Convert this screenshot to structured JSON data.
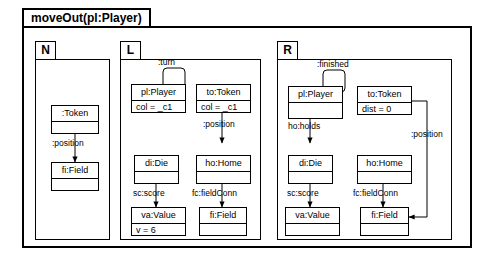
{
  "rule": {
    "title": "moveOut(pl:Player)"
  },
  "panels": [
    {
      "key": "N",
      "tab_label": "N",
      "nodes": [
        {
          "id": "n_token",
          "header": ":Token",
          "attr": ""
        },
        {
          "id": "n_field",
          "header": "fi:Field",
          "attr": ""
        }
      ],
      "edges": [
        {
          "label": ":position",
          "from": "n_token",
          "to": "n_field"
        }
      ]
    },
    {
      "key": "L",
      "tab_label": "L",
      "nodes": [
        {
          "id": "l_player",
          "header": "pl:Player",
          "attr": "col = _c1"
        },
        {
          "id": "l_token",
          "header": "to:Token",
          "attr": "col = _c1"
        },
        {
          "id": "l_die",
          "header": "di:Die",
          "attr": ""
        },
        {
          "id": "l_home",
          "header": "ho:Home",
          "attr": ""
        },
        {
          "id": "l_value",
          "header": "va:Value",
          "attr": "v = 6"
        },
        {
          "id": "l_field",
          "header": "fi:Field",
          "attr": ""
        }
      ],
      "edges": [
        {
          "label": ":turn",
          "from": "l_player",
          "to": "l_player"
        },
        {
          "label": ":position",
          "from": "l_token",
          "to": "l_home"
        },
        {
          "label": "sc:score",
          "from": "l_die",
          "to": "l_value"
        },
        {
          "label": "fc:fieldConn",
          "from": "l_home",
          "to": "l_field"
        }
      ]
    },
    {
      "key": "R",
      "tab_label": "R",
      "nodes": [
        {
          "id": "r_player",
          "header": "pl:Player",
          "attr": ""
        },
        {
          "id": "r_token",
          "header": "to:Token",
          "attr": "dist = 0"
        },
        {
          "id": "r_die",
          "header": "di:Die",
          "attr": ""
        },
        {
          "id": "r_home",
          "header": "ho:Home",
          "attr": ""
        },
        {
          "id": "r_value",
          "header": "va:Value",
          "attr": ""
        },
        {
          "id": "r_field",
          "header": "fi:Field",
          "attr": ""
        }
      ],
      "edges": [
        {
          "label": ":finished",
          "from": "r_player",
          "to": "r_player"
        },
        {
          "label": "ho:holds",
          "from": "r_player",
          "to": "r_die"
        },
        {
          "label": "sc:score",
          "from": "r_die",
          "to": "r_value"
        },
        {
          "label": "fc:fieldConn",
          "from": "r_home",
          "to": "r_field"
        },
        {
          "label": ":position",
          "from": "r_token",
          "to": "r_field"
        }
      ]
    }
  ],
  "labels": {
    "n_position": ":position",
    "l_turn": ":turn",
    "l_position": ":position",
    "l_score": "sc:score",
    "l_fieldconn": "fc:fieldConn",
    "r_finished": ":finished",
    "r_holds": "ho:holds",
    "r_score": "sc:score",
    "r_fieldconn": "fc:fieldConn",
    "r_position": ":position"
  },
  "colors": {
    "stroke": "#000000",
    "background": "#ffffff"
  }
}
